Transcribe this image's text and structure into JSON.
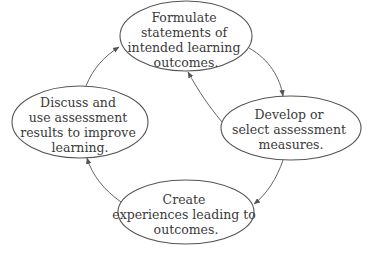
{
  "diagram": {
    "type": "cycle",
    "nodes": [
      {
        "id": "formulate",
        "lines": [
          "Formulate",
          "statements of",
          "intended learning",
          "outcomes."
        ],
        "cx": 186,
        "cy": 36,
        "rx": 66,
        "ry": 35
      },
      {
        "id": "develop",
        "lines": [
          "Develop or",
          "select assessment",
          "measures."
        ],
        "cx": 291,
        "cy": 128,
        "rx": 70,
        "ry": 32
      },
      {
        "id": "create",
        "lines": [
          "Create",
          "experiences leading to",
          "outcomes."
        ],
        "cx": 186,
        "cy": 212,
        "rx": 68,
        "ry": 32
      },
      {
        "id": "discuss",
        "lines": [
          "Discuss and",
          "use assessment",
          "results to improve",
          "learning."
        ],
        "cx": 80,
        "cy": 122,
        "rx": 68,
        "ry": 36
      }
    ],
    "edges": [
      {
        "from": "formulate",
        "to": "develop",
        "direction": "clockwise"
      },
      {
        "from": "develop",
        "to": "create",
        "direction": "clockwise"
      },
      {
        "from": "create",
        "to": "discuss",
        "direction": "clockwise"
      },
      {
        "from": "discuss",
        "to": "formulate",
        "direction": "clockwise"
      },
      {
        "from": "develop",
        "to": "formulate",
        "direction": "feedback"
      }
    ],
    "colors": {
      "stroke": "#555555",
      "text": "#3a3a3a",
      "background": "#ffffff"
    }
  }
}
